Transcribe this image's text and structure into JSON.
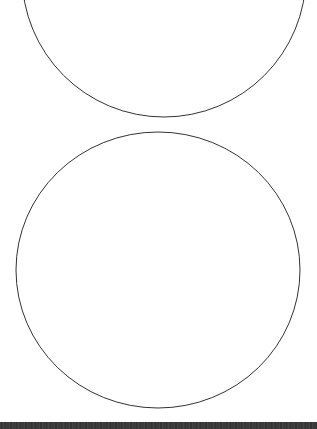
{
  "diagram": {
    "shapes": [
      {
        "id": "circle-top",
        "type": "circle",
        "cx": 164,
        "cy": -25,
        "r": 142,
        "stroke": "#333333",
        "fill": "none"
      },
      {
        "id": "circle-bottom",
        "type": "ellipse",
        "cx": 158,
        "cy": 270,
        "rx": 142,
        "ry": 138,
        "stroke": "#333333",
        "fill": "none"
      }
    ],
    "background": "#ffffff"
  },
  "footer": {
    "bar_color": "#3a3a3a"
  }
}
